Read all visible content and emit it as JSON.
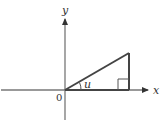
{
  "diagram": {
    "labels": {
      "x_axis": "x",
      "y_axis": "y",
      "origin": "0",
      "angle": "u"
    },
    "colors": {
      "axis": "#777777",
      "triangle": "#444444",
      "text": "#333333"
    }
  }
}
